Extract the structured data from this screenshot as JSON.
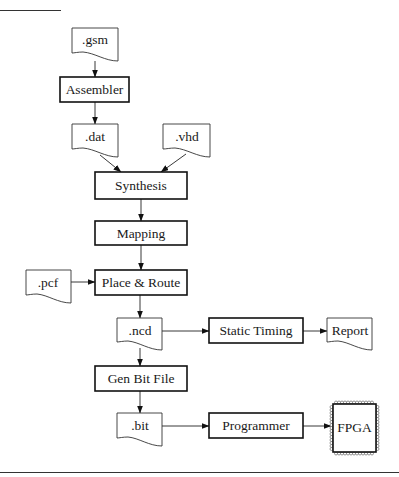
{
  "diagram": {
    "type": "design-flow",
    "nodes": {
      "gsm": {
        "label": ".gsm",
        "kind": "file"
      },
      "assembler": {
        "label": "Assembler",
        "kind": "process"
      },
      "dat": {
        "label": ".dat",
        "kind": "file"
      },
      "vhd": {
        "label": ".vhd",
        "kind": "file"
      },
      "synthesis": {
        "label": "Synthesis",
        "kind": "process"
      },
      "mapping": {
        "label": "Mapping",
        "kind": "process"
      },
      "pcf": {
        "label": ".pcf",
        "kind": "file"
      },
      "place_route": {
        "label": "Place & Route",
        "kind": "process"
      },
      "ncd": {
        "label": ".ncd",
        "kind": "file"
      },
      "static_timing": {
        "label": "Static Timing",
        "kind": "process"
      },
      "report": {
        "label": "Report",
        "kind": "file"
      },
      "gen_bit": {
        "label": "Gen Bit File",
        "kind": "process"
      },
      "bit": {
        "label": ".bit",
        "kind": "file"
      },
      "programmer": {
        "label": "Programmer",
        "kind": "process"
      },
      "fpga": {
        "label": "FPGA",
        "kind": "chip"
      }
    },
    "edges": [
      {
        "from": ".gsm",
        "to": "Assembler"
      },
      {
        "from": "Assembler",
        "to": ".dat"
      },
      {
        "from": ".dat",
        "to": "Synthesis"
      },
      {
        "from": ".vhd",
        "to": "Synthesis"
      },
      {
        "from": "Synthesis",
        "to": "Mapping"
      },
      {
        "from": "Mapping",
        "to": "Place & Route"
      },
      {
        "from": ".pcf",
        "to": "Place & Route"
      },
      {
        "from": "Place & Route",
        "to": ".ncd"
      },
      {
        "from": ".ncd",
        "to": "Static Timing"
      },
      {
        "from": "Static Timing",
        "to": "Report"
      },
      {
        "from": ".ncd",
        "to": "Gen Bit File"
      },
      {
        "from": "Gen Bit File",
        "to": ".bit"
      },
      {
        "from": ".bit",
        "to": "Programmer"
      },
      {
        "from": "Programmer",
        "to": "FPGA"
      }
    ]
  }
}
